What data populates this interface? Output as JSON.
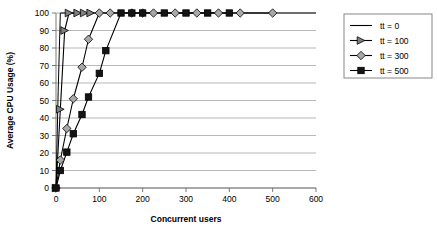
{
  "chart_data": {
    "type": "line",
    "title": "",
    "xlabel": "Concurrent users",
    "ylabel": "Average CPU Usage (%)",
    "xlim": [
      0,
      600
    ],
    "ylim": [
      0,
      100
    ],
    "xticks": [
      0,
      100,
      200,
      300,
      400,
      500,
      600
    ],
    "yticks": [
      0,
      10,
      20,
      30,
      40,
      50,
      60,
      70,
      80,
      90,
      100
    ],
    "grid": "horizontal",
    "legend_position": "right",
    "series": [
      {
        "name": "tt = 0",
        "marker": "none",
        "color": "#000000",
        "points": [
          {
            "x": 0,
            "y": 0
          },
          {
            "x": 5,
            "y": 55
          },
          {
            "x": 10,
            "y": 100
          },
          {
            "x": 600,
            "y": 100
          }
        ]
      },
      {
        "name": "tt = 100",
        "marker": "triangle-right",
        "color": "#000000",
        "marker_fill": "#808080",
        "points": [
          {
            "x": 0,
            "y": 0
          },
          {
            "x": 10,
            "y": 45
          },
          {
            "x": 20,
            "y": 90
          },
          {
            "x": 30,
            "y": 100
          },
          {
            "x": 50,
            "y": 100
          },
          {
            "x": 65,
            "y": 100
          },
          {
            "x": 80,
            "y": 100
          }
        ]
      },
      {
        "name": "tt = 300",
        "marker": "diamond",
        "color": "#000000",
        "marker_fill": "#a8a8a8",
        "points": [
          {
            "x": 0,
            "y": 0
          },
          {
            "x": 10,
            "y": 16
          },
          {
            "x": 25,
            "y": 34
          },
          {
            "x": 40,
            "y": 51
          },
          {
            "x": 60,
            "y": 69
          },
          {
            "x": 75,
            "y": 85
          },
          {
            "x": 100,
            "y": 100
          },
          {
            "x": 125,
            "y": 100
          },
          {
            "x": 175,
            "y": 100
          },
          {
            "x": 200,
            "y": 100
          },
          {
            "x": 225,
            "y": 100
          },
          {
            "x": 275,
            "y": 100
          },
          {
            "x": 325,
            "y": 100
          },
          {
            "x": 375,
            "y": 100
          },
          {
            "x": 425,
            "y": 100
          },
          {
            "x": 500,
            "y": 100
          }
        ]
      },
      {
        "name": "tt = 500",
        "marker": "square",
        "color": "#000000",
        "marker_fill": "#141414",
        "points": [
          {
            "x": 0,
            "y": 0
          },
          {
            "x": 10,
            "y": 10
          },
          {
            "x": 25,
            "y": 20.5
          },
          {
            "x": 40,
            "y": 31
          },
          {
            "x": 60,
            "y": 42
          },
          {
            "x": 75,
            "y": 52
          },
          {
            "x": 100,
            "y": 65.5
          },
          {
            "x": 115,
            "y": 78.5
          },
          {
            "x": 150,
            "y": 100
          },
          {
            "x": 175,
            "y": 100
          },
          {
            "x": 200,
            "y": 100
          },
          {
            "x": 250,
            "y": 100
          },
          {
            "x": 300,
            "y": 100
          },
          {
            "x": 350,
            "y": 100
          },
          {
            "x": 400,
            "y": 100
          }
        ]
      }
    ]
  },
  "legend": {
    "entries": [
      {
        "label": "tt = 0"
      },
      {
        "label": "tt = 100"
      },
      {
        "label": "tt = 300"
      },
      {
        "label": "tt = 500"
      }
    ]
  },
  "caption": {
    "text": ""
  }
}
